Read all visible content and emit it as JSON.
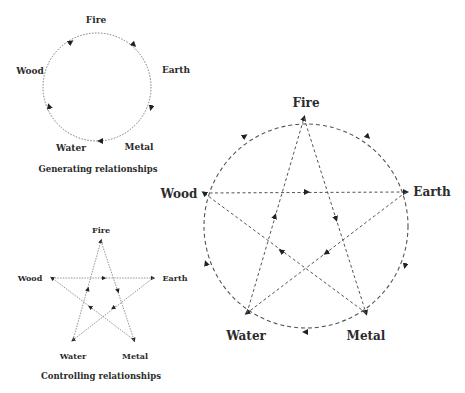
{
  "generating": {
    "title": "Generating relationships",
    "nodes": {
      "fire": "Fire",
      "earth": "Earth",
      "metal": "Metal",
      "water": "Water",
      "wood": "Wood"
    },
    "cycle": [
      "Wood",
      "Fire",
      "Earth",
      "Metal",
      "Water"
    ]
  },
  "controlling": {
    "title": "Controlling relationships",
    "nodes": {
      "fire": "Fire",
      "earth": "Earth",
      "metal": "Metal",
      "water": "Water",
      "wood": "Wood"
    },
    "edges": [
      [
        "Wood",
        "Earth"
      ],
      [
        "Earth",
        "Water"
      ],
      [
        "Water",
        "Fire"
      ],
      [
        "Fire",
        "Metal"
      ],
      [
        "Metal",
        "Wood"
      ]
    ]
  },
  "combined": {
    "nodes": {
      "fire": "Fire",
      "earth": "Earth",
      "metal": "Metal",
      "water": "Water",
      "wood": "Wood"
    },
    "generating_cycle": [
      "Wood",
      "Fire",
      "Earth",
      "Metal",
      "Water"
    ],
    "controlling_edges": [
      [
        "Wood",
        "Earth"
      ],
      [
        "Earth",
        "Water"
      ],
      [
        "Water",
        "Fire"
      ],
      [
        "Fire",
        "Metal"
      ],
      [
        "Metal",
        "Wood"
      ]
    ]
  },
  "colors": {
    "line": "#555555",
    "arrow": "#222222",
    "text": "#2b2b2b"
  }
}
